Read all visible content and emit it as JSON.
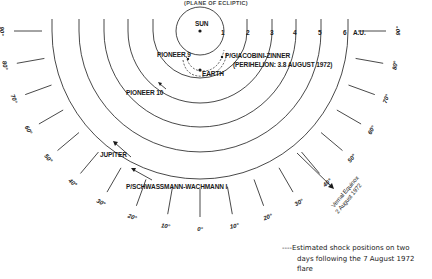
{
  "header": {
    "caption": "(PLANE OF ECLIPTIC)"
  },
  "bodies": {
    "sun": "SUN",
    "earth": "EARTH",
    "pioneer9": "PIONEER 9",
    "pioneer10": "PIONEER 10",
    "jupiter": "JUPITER",
    "giacobini": "P/GIACOBINI-ZINNER",
    "giacobini_note": "(PERIHELION: 3.8 AUGUST 1972)",
    "schwassmann": "P/SCHWASSMANN-WACHMANN I"
  },
  "au_scale": {
    "unit": "A.U.",
    "labels": [
      "1",
      "2",
      "3",
      "4",
      "5",
      "6"
    ]
  },
  "angle_ticks": {
    "left": [
      "90°",
      "80°",
      "70°",
      "60°",
      "50°",
      "40°",
      "30°",
      "20°",
      "10°"
    ],
    "center": "0°",
    "right": [
      "10°",
      "20°",
      "30°",
      "40°",
      "50°",
      "60°",
      "70°",
      "80°",
      "90°"
    ]
  },
  "vernal_equinox": {
    "line1": "Vernal Equinox",
    "line2": "2 August 1972"
  },
  "legend": {
    "line1": "----Estimated shock positions on two",
    "line2": "days following the 7 August 1972",
    "line3": "flare"
  }
}
